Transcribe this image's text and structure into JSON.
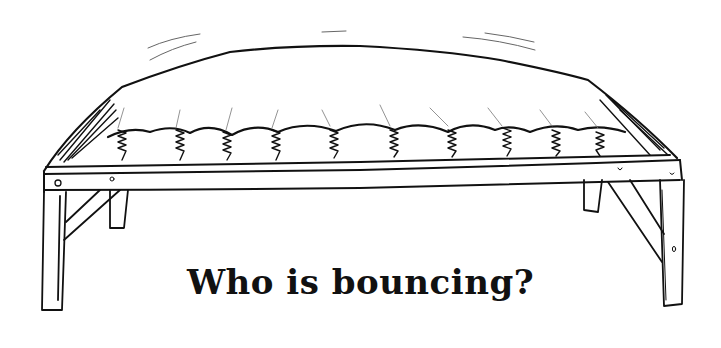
{
  "illustration": {
    "subject": "mattress on wooden bench frame with coil springs",
    "motion_lines": true
  },
  "caption": {
    "text": "Who is bouncing?"
  },
  "colors": {
    "background": "#ffffff",
    "ink": "#111111"
  }
}
